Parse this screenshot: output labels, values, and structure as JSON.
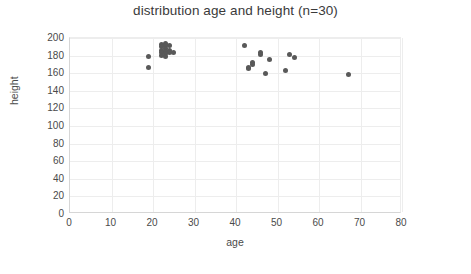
{
  "chart_data": {
    "type": "scatter",
    "title": "distribution age and height (n=30)",
    "xlabel": "age",
    "ylabel": "height",
    "xlim": [
      0,
      80
    ],
    "ylim": [
      0,
      200
    ],
    "xticks": [
      0,
      10,
      20,
      30,
      40,
      50,
      60,
      70,
      80
    ],
    "yticks": [
      0,
      20,
      40,
      60,
      80,
      100,
      120,
      140,
      160,
      180,
      200
    ],
    "grid": true,
    "legend": null,
    "marker_color": "#595959",
    "series": [
      {
        "name": "age vs height",
        "points": [
          [
            19,
            179
          ],
          [
            19,
            166
          ],
          [
            22,
            193
          ],
          [
            22,
            190
          ],
          [
            22,
            186
          ],
          [
            22,
            183
          ],
          [
            22,
            180
          ],
          [
            23,
            194
          ],
          [
            23,
            191
          ],
          [
            23,
            188
          ],
          [
            23,
            185
          ],
          [
            23,
            182
          ],
          [
            23,
            179
          ],
          [
            24,
            192
          ],
          [
            24,
            186
          ],
          [
            24,
            183
          ],
          [
            25,
            183
          ],
          [
            42,
            191
          ],
          [
            43,
            167
          ],
          [
            43,
            165
          ],
          [
            44,
            172
          ],
          [
            44,
            170
          ],
          [
            46,
            183
          ],
          [
            46,
            181
          ],
          [
            47,
            160
          ],
          [
            48,
            176
          ],
          [
            52,
            163
          ],
          [
            53,
            181
          ],
          [
            54,
            178
          ],
          [
            67,
            159
          ]
        ]
      }
    ]
  }
}
